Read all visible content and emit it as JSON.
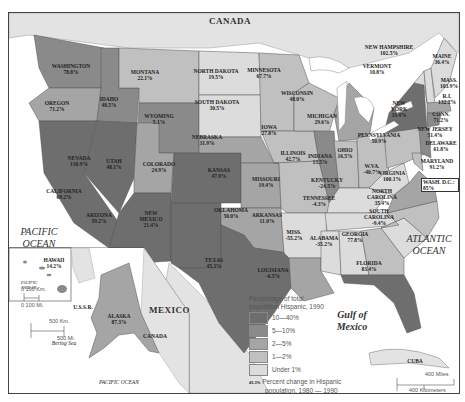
{
  "map": {
    "title": "Percentage of total population Hispanic, 1990",
    "countries": [
      "CANADA",
      "MEXICO"
    ],
    "oceans": [
      {
        "name": "PACIFIC OCEAN",
        "line1": "PACIFIC",
        "line2": "OCEAN"
      },
      {
        "name": "ATLANTIC OCEAN",
        "line1": "ATLANTIC",
        "line2": "OCEAN"
      },
      {
        "name": "Gulf of Mexico",
        "line1": "Gulf of",
        "line2": "Mexico"
      }
    ],
    "other_labels": {
      "cuba": "CUBA",
      "ussr": "U.S.S.R.",
      "bering_sea": "Bering Sea",
      "inset_pacific": "PACIFIC OCEAN",
      "hawaii_pacific_1": "PACIFIC",
      "hawaii_pacific_2": "OCEAN",
      "inset_canada": "CANADA",
      "wash_dc": "WASH. D.C.: 85%"
    },
    "states": [
      {
        "name": "WASHINGTON",
        "change": "78.8%",
        "category": "5—10%"
      },
      {
        "name": "OREGON",
        "change": "71.2%",
        "category": "2—5%"
      },
      {
        "name": "CALIFORNIA",
        "change": "69.2%",
        "category": "10—40%"
      },
      {
        "name": "NEVADA",
        "change": "130.9%",
        "category": "10—40%"
      },
      {
        "name": "IDAHO",
        "change": "48.5%",
        "category": "5—10%"
      },
      {
        "name": "MONTANA",
        "change": "22.1%",
        "category": "1—2%"
      },
      {
        "name": "WYOMING",
        "change": "5.1%",
        "category": "5—10%"
      },
      {
        "name": "UTAH",
        "change": "48.1%",
        "category": "2—5%"
      },
      {
        "name": "ARIZONA",
        "change": "59.2%",
        "category": "10—40%"
      },
      {
        "name": "COLORADO",
        "change": "24.9%",
        "category": "10—40%"
      },
      {
        "name": "NEW MEXICO",
        "change": "21.4%",
        "category": "10—40%"
      },
      {
        "name": "NORTH DAKOTA",
        "change": "19.5%",
        "category": "Under 1%"
      },
      {
        "name": "SOUTH DAKOTA",
        "change": "30.5%",
        "category": "Under 1%"
      },
      {
        "name": "NEBRASKA",
        "change": "31.9%",
        "category": "2—5%"
      },
      {
        "name": "KANSAS",
        "change": "47.9%",
        "category": "2—5%"
      },
      {
        "name": "OKLAHOMA",
        "change": "50.0%",
        "category": "2—5%"
      },
      {
        "name": "TEXAS",
        "change": "45.3%",
        "category": "10—40%"
      },
      {
        "name": "MINNESOTA",
        "change": "67.7%",
        "category": "1—2%"
      },
      {
        "name": "IOWA",
        "change": "27.8%",
        "category": "1—2%"
      },
      {
        "name": "MISSOURI",
        "change": "19.4%",
        "category": "1—2%"
      },
      {
        "name": "ARKANSAS",
        "change": "11.0%",
        "category": "Under 1%"
      },
      {
        "name": "LOUISIANA",
        "change": "-6.5%",
        "category": "2—5%"
      },
      {
        "name": "WISCONSIN",
        "change": "48.0%",
        "category": "1—2%"
      },
      {
        "name": "ILLINOIS",
        "change": "42.7%",
        "category": "5—10%"
      },
      {
        "name": "MICHIGAN",
        "change": "29.6%",
        "category": "2—5%"
      },
      {
        "name": "INDIANA",
        "change": "13.5%",
        "category": "1—2%"
      },
      {
        "name": "OHIO",
        "change": "16.5%",
        "category": "1—2%"
      },
      {
        "name": "KENTUCKY",
        "change": "-24.5%",
        "category": "Under 1%"
      },
      {
        "name": "TENNESSEE",
        "change": "-4.3%",
        "category": "Under 1%"
      },
      {
        "name": "MISS.",
        "change": "-55.2%",
        "category": "Under 1%"
      },
      {
        "name": "ALABAMA",
        "change": "-35.2%",
        "category": "Under 1%"
      },
      {
        "name": "GEORGIA",
        "change": "77.8%",
        "category": "1—2%"
      },
      {
        "name": "FLORIDA",
        "change": "83.4%",
        "category": "10—40%"
      },
      {
        "name": "SOUTH CAROLINA",
        "change": "-9.4%",
        "category": "Under 1%"
      },
      {
        "name": "NORTH CAROLINA",
        "change": "35.4%",
        "category": "1—2%"
      },
      {
        "name": "VIRGINIA",
        "change": "100.1%",
        "category": "2—5%"
      },
      {
        "name": "W.VA.",
        "change": "-40.7%",
        "category": "Under 1%"
      },
      {
        "name": "PENNSYLVANIA",
        "change": "50.9%",
        "category": "1—2%"
      },
      {
        "name": "NEW YORK",
        "change": "33.4%",
        "category": "10—40%"
      },
      {
        "name": "VERMONT",
        "change": "10.8%",
        "category": "Under 1%"
      },
      {
        "name": "NEW HAMPSHIRE",
        "change": "102.5%",
        "category": "Under 1%"
      },
      {
        "name": "MAINE",
        "change": "36.4%",
        "category": "Under 1%"
      },
      {
        "name": "MASS.",
        "change": "103.9%",
        "category": "2—5%"
      },
      {
        "name": "R.I.",
        "change": "132.2%",
        "category": "2—5%"
      },
      {
        "name": "CONN.",
        "change": "71.2%",
        "category": "5—10%"
      },
      {
        "name": "NEW JERSEY",
        "change": "51.4%",
        "category": "5—10%"
      },
      {
        "name": "DELAWARE",
        "change": "61.8%",
        "category": "1—2%"
      },
      {
        "name": "MARYLAND",
        "change": "91.2%",
        "category": "2—5%"
      },
      {
        "name": "HAWAII",
        "change": "14.2%",
        "category": "5—10%"
      },
      {
        "name": "ALASKA",
        "change": "87.3%",
        "category": "2—5%"
      }
    ]
  },
  "legend": {
    "title_line1": "Percentage of total",
    "title_line2": "population Hispanic, 1990",
    "items": [
      {
        "label": "10—40%",
        "color": "#6e6e6e"
      },
      {
        "label": "5—10%",
        "color": "#8a8a8a"
      },
      {
        "label": "2—5%",
        "color": "#a5a5a5"
      },
      {
        "label": "1—2%",
        "color": "#c0c0c0"
      },
      {
        "label": "Under 1%",
        "color": "#dcdcdc"
      }
    ],
    "note_sample": "45.3%",
    "note_line1": "Percent change in Hispanic",
    "note_line2": "population, 1980 — 1990"
  },
  "scale": {
    "main_miles": "400 Miles",
    "main_km": "400 Kilometers",
    "zero": "0",
    "alaska_km": "500 Km.",
    "alaska_mi": "500 Mi.",
    "hawaii_km": "100 Km.",
    "hawaii_mi": "100 Mi."
  }
}
